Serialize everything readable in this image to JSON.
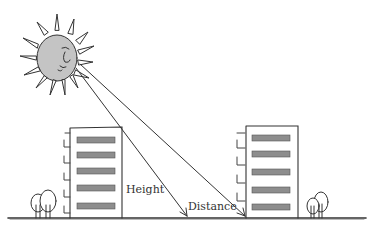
{
  "diagram": {
    "labels": {
      "height": "Height",
      "distance": "Distance"
    },
    "colors": {
      "ink": "#333333",
      "sun_fill": "#bdbdbd",
      "window_fill": "#8a8a8a",
      "background": "#ffffff"
    },
    "elements": {
      "sun": "sun-with-face",
      "left_building": "building-with-balconies",
      "right_building": "building-with-balconies",
      "sun_rays": 2,
      "trees": 2
    }
  }
}
